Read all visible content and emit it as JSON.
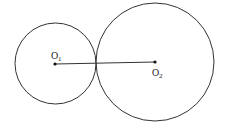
{
  "diagram": {
    "type": "tangent-circles",
    "stroke_color": "#333333",
    "circles": [
      {
        "name": "circle-o1",
        "cx": 55.5,
        "cy": 63.5,
        "r": 40.5,
        "center_label": "O",
        "center_sub": "1"
      },
      {
        "name": "circle-o2",
        "cx": 155,
        "cy": 62,
        "r": 59,
        "center_label": "O",
        "center_sub": "2"
      }
    ],
    "segment": {
      "from": "O1",
      "to": "O2"
    }
  }
}
